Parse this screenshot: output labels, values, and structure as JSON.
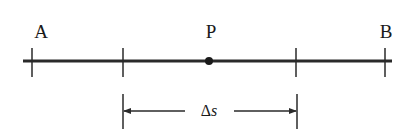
{
  "figure": {
    "line_color": "#2a2a2a",
    "points": {
      "A": {
        "label": "A"
      },
      "P": {
        "label": "P"
      },
      "B": {
        "label": "B"
      }
    },
    "interval": {
      "symbol": "Δ",
      "variable": "s"
    }
  }
}
